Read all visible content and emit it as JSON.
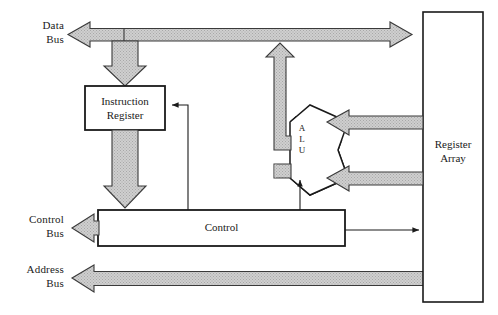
{
  "diagram": {
    "background_color": "#ffffff",
    "line_color": "#1a1a1a",
    "bus_fill_color": "#c9c9c9",
    "bus_outline_color": "#333333",
    "buses": [
      {
        "name": "data-bus",
        "label": "Data\nBus",
        "direction": "bidirectional",
        "orientation": "horizontal"
      },
      {
        "name": "control-bus",
        "label": "Control\nBus",
        "direction": "out",
        "orientation": "horizontal"
      },
      {
        "name": "address-bus",
        "label": "Address\nBus",
        "direction": "out",
        "orientation": "horizontal"
      }
    ],
    "blocks": [
      {
        "name": "instruction-register",
        "label": "Instruction\nRegister"
      },
      {
        "name": "control",
        "label": "Control"
      },
      {
        "name": "alu",
        "label": "A\nL\nU"
      },
      {
        "name": "register-array",
        "label": "Register\nArray"
      }
    ],
    "connections": [
      {
        "name": "data-bus-to-instruction-register",
        "from": "data-bus",
        "to": "instruction-register",
        "style": "thick-arrow"
      },
      {
        "name": "instruction-register-to-control",
        "from": "instruction-register",
        "to": "control",
        "style": "thick-arrow"
      },
      {
        "name": "alu-to-data-bus",
        "from": "alu",
        "to": "data-bus",
        "style": "thick-arrow"
      },
      {
        "name": "register-array-to-alu-upper",
        "from": "register-array",
        "to": "alu",
        "style": "thick-arrow"
      },
      {
        "name": "register-array-to-alu-lower",
        "from": "register-array",
        "to": "alu",
        "style": "thick-arrow"
      },
      {
        "name": "control-to-instruction-register",
        "from": "control",
        "to": "instruction-register",
        "style": "thin-line"
      },
      {
        "name": "control-to-alu",
        "from": "control",
        "to": "alu",
        "style": "thin-line"
      },
      {
        "name": "control-to-register-array",
        "from": "control",
        "to": "register-array",
        "style": "thin-line"
      },
      {
        "name": "data-bus-to-register-array",
        "from": "data-bus",
        "to": "register-array",
        "style": "thick-arrow"
      },
      {
        "name": "register-array-to-address-bus",
        "from": "register-array",
        "to": "address-bus",
        "style": "thick-arrow"
      },
      {
        "name": "control-to-control-bus",
        "from": "control",
        "to": "control-bus",
        "style": "thick-arrow"
      }
    ]
  }
}
